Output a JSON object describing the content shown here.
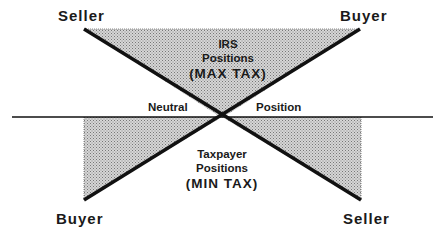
{
  "diagram": {
    "type": "crossed-triangles",
    "colors": {
      "line": "#111111",
      "fill": "#b8b8b8",
      "background": "#ffffff"
    },
    "top_labels": {
      "left": "Seller",
      "right": "Buyer"
    },
    "bottom_labels": {
      "left": "Buyer",
      "right": "Seller"
    },
    "axis_labels": {
      "left": "Neutral",
      "right": "Position"
    },
    "irs_region": {
      "line1": "IRS",
      "line2": "Positions",
      "line3": "(MAX TAX)"
    },
    "taxpayer_region": {
      "line1": "Taxpayer",
      "line2": "Positions",
      "line3": "(MIN TAX)"
    }
  }
}
